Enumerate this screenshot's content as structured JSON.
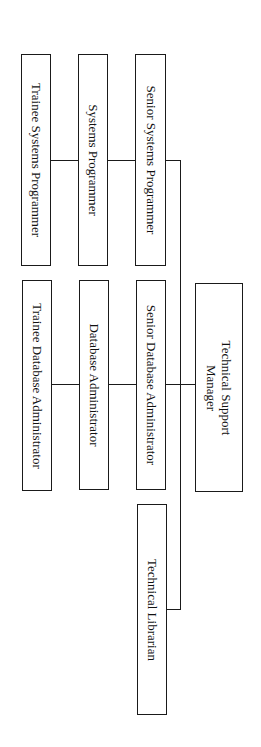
{
  "chart": {
    "type": "org-chart",
    "orientation": "rotated-90-clockwise",
    "root": {
      "label_line1": "Technical Support",
      "label_line2": "Manager"
    },
    "branches": {
      "systems": {
        "senior": "Senior Systems Programmer",
        "mid": "Systems Programmer",
        "trainee": "Trainee Systems Programmer"
      },
      "database": {
        "senior": "Senior Database Administrator",
        "mid": "Database Administrator",
        "trainee": "Trainee Database Administrator"
      },
      "library": {
        "role": "Technical Librarian"
      }
    }
  },
  "colors": {
    "background": "#ffffff",
    "line": "#1a1a1a",
    "text": "#111111"
  }
}
